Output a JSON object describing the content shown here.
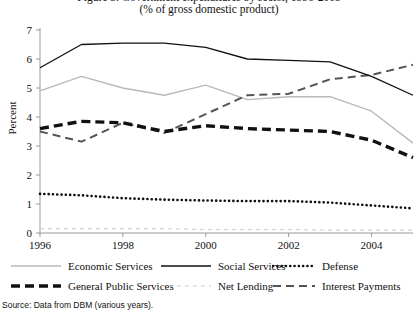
{
  "title": {
    "line1": "Figure 3. Government expenditures by sector, 1996-2005",
    "line2": "(% of gross domestic product)"
  },
  "source": "Source: Data from DBM (various years).",
  "axes": {
    "ylabel": "Percent",
    "yticks": [
      "0",
      "1",
      "2",
      "3",
      "4",
      "5",
      "6",
      "7"
    ],
    "xticks": [
      "1996",
      "1998",
      "2000",
      "2002",
      "2004"
    ]
  },
  "legend": {
    "items": [
      {
        "label": "Economic Services",
        "style": "thin-solid-gray",
        "color": "#b9b9b9"
      },
      {
        "label": "Social Services",
        "style": "thin-solid-black",
        "color": "#111111"
      },
      {
        "label": "Defense",
        "style": "dotted-black",
        "color": "#111111"
      },
      {
        "label": "General Public Services",
        "style": "thick-dashed-black",
        "color": "#111111"
      },
      {
        "label": "Net Lending",
        "style": "dashed-lightgray",
        "color": "#d2d2d2"
      },
      {
        "label": "Interest Payments",
        "style": "dashed-gray",
        "color": "#555555"
      }
    ]
  },
  "chart_data": {
    "type": "line",
    "title": "Figure 3. Government expenditures by sector, 1996-2005",
    "subtitle": "(% of gross domestic product)",
    "xlabel": "",
    "ylabel": "Percent",
    "x": [
      1996,
      1997,
      1998,
      1999,
      2000,
      2001,
      2002,
      2003,
      2004,
      2005
    ],
    "xlim": [
      1996,
      2005
    ],
    "ylim": [
      0,
      7
    ],
    "yticks": [
      0,
      1,
      2,
      3,
      4,
      5,
      6,
      7
    ],
    "xticks": [
      1996,
      1998,
      2000,
      2002,
      2004
    ],
    "grid": false,
    "legend_position": "bottom",
    "series": [
      {
        "name": "Economic Services",
        "color": "#b9b9b9",
        "style": "thin-solid-gray",
        "values": [
          4.9,
          5.4,
          5.0,
          4.75,
          5.1,
          4.6,
          4.7,
          4.7,
          4.2,
          3.1
        ]
      },
      {
        "name": "Social Services",
        "color": "#111111",
        "style": "thin-solid-black",
        "values": [
          5.7,
          6.5,
          6.55,
          6.55,
          6.4,
          6.0,
          5.95,
          5.9,
          5.4,
          4.75
        ]
      },
      {
        "name": "Defense",
        "color": "#111111",
        "style": "dotted-black",
        "values": [
          1.35,
          1.3,
          1.2,
          1.15,
          1.12,
          1.1,
          1.1,
          1.05,
          0.95,
          0.85
        ]
      },
      {
        "name": "General Public Services",
        "color": "#111111",
        "style": "thick-dashed-black",
        "values": [
          3.6,
          3.85,
          3.8,
          3.5,
          3.7,
          3.6,
          3.55,
          3.5,
          3.2,
          2.6
        ]
      },
      {
        "name": "Net Lending",
        "color": "#d2d2d2",
        "style": "dashed-lightgray",
        "values": [
          0.15,
          0.15,
          0.15,
          0.15,
          0.12,
          0.12,
          0.12,
          0.1,
          0.1,
          0.1
        ]
      },
      {
        "name": "Interest Payments",
        "color": "#555555",
        "style": "dashed-gray",
        "values": [
          3.5,
          3.15,
          3.8,
          3.45,
          4.1,
          4.75,
          4.8,
          5.3,
          5.45,
          5.8
        ]
      }
    ]
  }
}
